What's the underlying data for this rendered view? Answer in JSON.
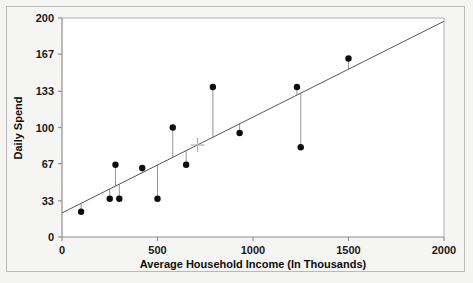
{
  "chart_data": {
    "type": "scatter",
    "title": "",
    "xlabel": "Average Household Income (In Thousands)",
    "ylabel": "Daily Spend",
    "xlim": [
      0,
      2000
    ],
    "ylim": [
      0,
      200
    ],
    "xticks": [
      0,
      500,
      1000,
      1500,
      2000
    ],
    "xtick_labels": [
      "0",
      "500",
      "1000",
      "1500",
      "2000"
    ],
    "yticks": [
      0,
      33,
      67,
      100,
      133,
      167,
      200
    ],
    "ytick_labels": [
      "0",
      "33",
      "67",
      "100",
      "133",
      "167",
      "200"
    ],
    "grid": false,
    "legend": null,
    "points": [
      {
        "x": 100,
        "y": 23
      },
      {
        "x": 250,
        "y": 35
      },
      {
        "x": 280,
        "y": 66
      },
      {
        "x": 300,
        "y": 35
      },
      {
        "x": 420,
        "y": 63
      },
      {
        "x": 500,
        "y": 35
      },
      {
        "x": 580,
        "y": 100
      },
      {
        "x": 650,
        "y": 66
      },
      {
        "x": 790,
        "y": 137
      },
      {
        "x": 930,
        "y": 95
      },
      {
        "x": 1230,
        "y": 137
      },
      {
        "x": 1250,
        "y": 82
      },
      {
        "x": 1500,
        "y": 163
      }
    ],
    "regression_line": {
      "x0": 0,
      "y0": 22,
      "x1": 2000,
      "y1": 197,
      "slope": 0.0875,
      "intercept": 22
    },
    "residual_stems": true,
    "centroid_marker": {
      "x": 710,
      "y": 84,
      "style": "plus"
    },
    "marker_color": "#0d0d0d",
    "line_color": "#555555",
    "stem_color": "#8a8a8a",
    "centroid_color": "#aaaaaa",
    "axis_color": "#9a9a98",
    "plot_background": "#ffffff",
    "page_background": "#f4f4f2"
  },
  "axis_labels": {
    "y_title": "Daily Spend",
    "x_title": "Average Household Income (In Thousands)"
  }
}
